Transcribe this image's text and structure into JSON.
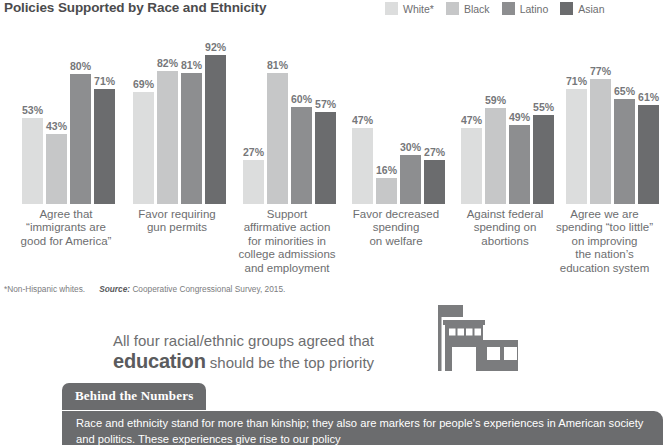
{
  "header": {
    "title": "Policies Supported by Race and Ethnicity"
  },
  "legend": {
    "items": [
      {
        "label": "White*",
        "color": "#dcdddd"
      },
      {
        "label": "Black",
        "color": "#c6c7c8"
      },
      {
        "label": "Latino",
        "color": "#8d8e90"
      },
      {
        "label": "Asian",
        "color": "#6b6c6e"
      }
    ]
  },
  "chart_data": {
    "type": "bar",
    "title": "Policies Supported by Race and Ethnicity",
    "xlabel": "",
    "ylabel": "",
    "ylim": [
      0,
      100
    ],
    "grid": false,
    "legend_position": "top-right",
    "value_suffix": "%",
    "categories": [
      "Agree that “immigrants are good for America”",
      "Favor requiring gun permits",
      "Support affirmative action for minorities in college admissions and employment",
      "Favor decreased spending on welfare",
      "Against federal spending on abortions",
      "Agree we are spending “too little” on improving the nation’s education system"
    ],
    "series": [
      {
        "name": "White*",
        "color": "#dcdddd",
        "values": [
          53,
          69,
          27,
          47,
          47,
          71
        ]
      },
      {
        "name": "Black",
        "color": "#c6c7c8",
        "values": [
          43,
          82,
          81,
          16,
          59,
          77
        ]
      },
      {
        "name": "Latino",
        "color": "#8d8e90",
        "values": [
          80,
          81,
          60,
          30,
          49,
          65
        ]
      },
      {
        "name": "Asian",
        "color": "#6b6c6e",
        "values": [
          71,
          92,
          57,
          27,
          55,
          61
        ]
      }
    ]
  },
  "xlabels": [
    {
      "lines": [
        "Agree that",
        "“immigrants are",
        "good for America”"
      ]
    },
    {
      "lines": [
        "Favor requiring",
        "gun permits"
      ]
    },
    {
      "lines": [
        "Support",
        "affirmative action",
        "for minorities in",
        "college admissions",
        "and employment"
      ]
    },
    {
      "lines": [
        "Favor decreased",
        "spending",
        "on welfare"
      ]
    },
    {
      "lines": [
        "Against federal",
        "spending on",
        "abortions"
      ]
    },
    {
      "lines": [
        "Agree we are",
        "spending “too little”",
        "on improving",
        "the nation’s",
        "education system"
      ]
    }
  ],
  "footnote": {
    "note": "*Non-Hispanic whites.",
    "source_label": "Source:",
    "source_text": "Cooperative Congressional Survey, 2015."
  },
  "callout": {
    "line1": "All four racial/ethnic groups agreed that",
    "emphasis": "education",
    "line2_rest": "should be the top priority"
  },
  "behind_the_numbers": {
    "tab_label": "Behind the Numbers",
    "body": "Race and ethnicity stand for more than kinship; they also are markers for people's experiences in American society and politics. These experiences give rise to our policy"
  }
}
